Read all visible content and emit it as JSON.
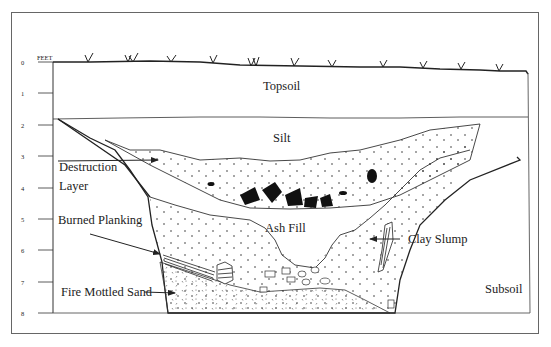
{
  "diagram": {
    "type": "stratigraphic-profile",
    "scale": {
      "unit_label": "FEET",
      "ticks": [
        "0",
        "1",
        "2",
        "3",
        "4",
        "5",
        "6",
        "7",
        "8"
      ]
    },
    "layers": {
      "topsoil": "Topsoil",
      "silt": "Silt",
      "ash_fill": "Ash Fill",
      "subsoil": "Subsoil"
    },
    "annotations": {
      "destruction_line1": "Destruction",
      "destruction_line2": "Layer",
      "burned_planking": "Burned Planking",
      "fire_mottled_sand": "Fire Mottled Sand",
      "clay_slump": "Clay Slump"
    },
    "colors": {
      "ink": "#222222",
      "frame": "#555555",
      "background": "#ffffff"
    }
  }
}
